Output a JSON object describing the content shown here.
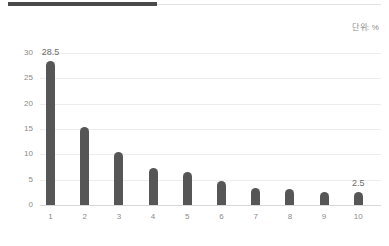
{
  "header": {
    "rule_dark_color": "#4a4a4a",
    "rule_light_color": "#e3e3e3"
  },
  "unit_note": "단위: %",
  "chart_data": {
    "type": "bar",
    "title": "",
    "subtitle": "",
    "xlabel": "",
    "ylabel": "",
    "unit": "%",
    "categories": [
      "1",
      "2",
      "3",
      "4",
      "5",
      "6",
      "7",
      "8",
      "9",
      "10"
    ],
    "values": [
      28.5,
      15.3,
      10.5,
      7.3,
      6.5,
      4.8,
      3.4,
      3.2,
      2.6,
      2.5
    ],
    "point_labels": [
      {
        "category": "1",
        "value": 28.5,
        "text": "28.5"
      },
      {
        "category": "10",
        "value": 2.5,
        "text": "2.5"
      }
    ],
    "ylim": [
      0,
      30
    ],
    "yticks": [
      30,
      25,
      20,
      15,
      10,
      5,
      0
    ],
    "ytick_labels": [
      "30",
      "25",
      "20",
      "15",
      "10",
      "5",
      "0"
    ],
    "grid": true,
    "grid_axis": "y",
    "legend": null,
    "legend_position": "none",
    "bar_color": "#565656",
    "grid_color": "#ededed",
    "baseline_color": "#d8d8d8",
    "tick_label_color": "#8a8a8a",
    "data_label_color": "#6b6b6b"
  }
}
